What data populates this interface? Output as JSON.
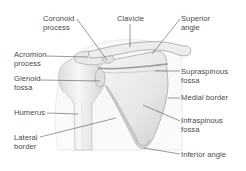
{
  "diagram": {
    "labels": [
      {
        "id": "coronoid-process",
        "text": "Coronoid\nprocess",
        "x": 43,
        "y": 15
      },
      {
        "id": "clavicle",
        "text": "Clavicle",
        "x": 117,
        "y": 15
      },
      {
        "id": "superior-angle",
        "text": "Superior\nangle",
        "x": 181,
        "y": 15
      },
      {
        "id": "acromion-process",
        "text": "Acromion\nprocess",
        "x": 14,
        "y": 51
      },
      {
        "id": "glenoid-fossa",
        "text": "Glenoid\nfossa",
        "x": 14,
        "y": 75
      },
      {
        "id": "supraspinous-fossa",
        "text": "Supraspinous\nfossa",
        "x": 181,
        "y": 68
      },
      {
        "id": "humerus",
        "text": "Humerus",
        "x": 14,
        "y": 109
      },
      {
        "id": "medial-border",
        "text": "Medial border",
        "x": 181,
        "y": 94
      },
      {
        "id": "lateral-border",
        "text": "Lateral\nborder",
        "x": 14,
        "y": 134
      },
      {
        "id": "infraspinous-fossa",
        "text": "Infraspinous\nfossa",
        "x": 181,
        "y": 117
      },
      {
        "id": "inferior-angle",
        "text": "Inferior angle",
        "x": 181,
        "y": 151
      }
    ],
    "colors": {
      "background": "#ffffff",
      "label_text": "#4a4a4a",
      "leader_line": "#555555",
      "bone_fill": "#ececec",
      "bone_shadow": "#c9c9c9",
      "body_silhouette": "#f3f3f3"
    }
  }
}
